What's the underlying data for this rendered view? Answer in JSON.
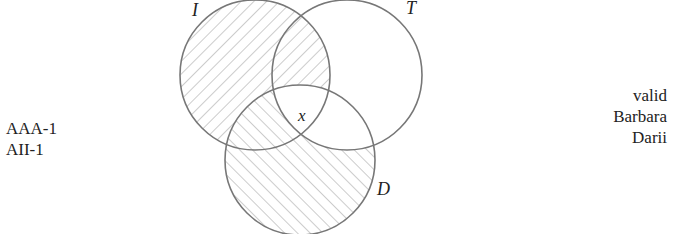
{
  "diagram": {
    "type": "venn",
    "sets": [
      {
        "name": "I",
        "label": "I",
        "cx": 255,
        "cy": 75,
        "r": 75
      },
      {
        "name": "T",
        "label": "T",
        "cx": 347,
        "cy": 75,
        "r": 75
      },
      {
        "name": "D",
        "label": "D",
        "cx": 300,
        "cy": 160,
        "r": 75
      }
    ],
    "shaded_regions": [
      "I only",
      "I∩T not D",
      "D only",
      "I∩D not T",
      "T∩D not I"
    ],
    "marker": {
      "label": "x",
      "region": "I∩T∩D"
    },
    "stroke_color": "#777777",
    "hatch_color": "#999999"
  },
  "left_labels": [
    "AAA-1",
    "AII-1"
  ],
  "right_labels": [
    "valid",
    "Barbara",
    "Darii"
  ]
}
